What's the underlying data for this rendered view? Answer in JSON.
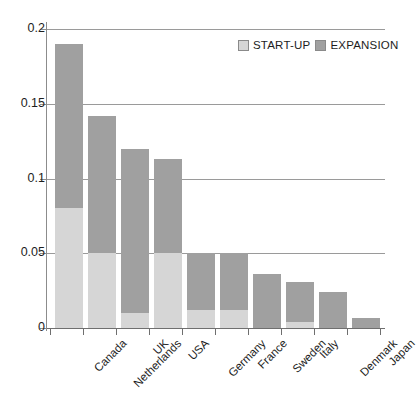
{
  "chart_data": {
    "type": "bar",
    "title": "",
    "subtitle": "",
    "xlabel": "",
    "ylabel": "",
    "stacked": true,
    "orientation": "vertical",
    "grid": true,
    "legend_position": "top-right",
    "ylim": [
      0,
      0.2
    ],
    "yticks": [
      0,
      0.05,
      0.1,
      0.15,
      0.2
    ],
    "ytick_labels": [
      "0",
      "0.05",
      "0.1",
      "0.15",
      "0.2"
    ],
    "categories": [
      "Canada",
      "Netherlands",
      "UK",
      "USA",
      "Germany",
      "France",
      "Sweden",
      "Italy",
      "Denmark",
      "Japan"
    ],
    "series": [
      {
        "name": "START-UP",
        "color": "#d6d6d6",
        "values": [
          0.08,
          0.05,
          0.01,
          0.05,
          0.012,
          0.012,
          0.0,
          0.004,
          0.0,
          0.0
        ]
      },
      {
        "name": "EXPANSION",
        "color": "#a0a0a0",
        "values": [
          0.11,
          0.092,
          0.11,
          0.063,
          0.038,
          0.038,
          0.036,
          0.027,
          0.024,
          0.007
        ]
      }
    ],
    "totals": [
      0.19,
      0.142,
      0.12,
      0.113,
      0.05,
      0.05,
      0.036,
      0.031,
      0.024,
      0.007
    ]
  },
  "legend": {
    "items": [
      {
        "label": "START-UP",
        "color": "#d6d6d6"
      },
      {
        "label": "EXPANSION",
        "color": "#a0a0a0"
      }
    ]
  },
  "colors": {
    "startup": "#d6d6d6",
    "expansion": "#a0a0a0",
    "axis": "#6f6f6f",
    "gridline": "#9a9a9a",
    "text": "#1d1d1d",
    "background": "#ffffff"
  }
}
